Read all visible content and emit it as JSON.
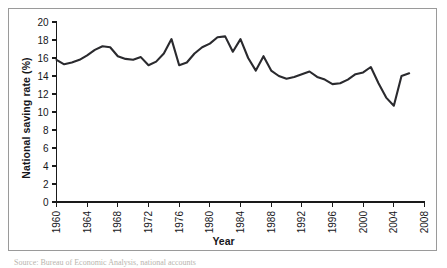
{
  "figure": {
    "caption_sliver": "Source: Bureau of Economic Analysis, national accounts"
  },
  "chart_data": {
    "type": "line",
    "title": "",
    "xlabel": "Year",
    "ylabel": "National saving rate (%)",
    "xlim": [
      1960,
      2008
    ],
    "ylim": [
      0,
      20
    ],
    "grid": false,
    "legend": "none",
    "x_ticks": [
      1960,
      1964,
      1968,
      1972,
      1976,
      1980,
      1984,
      1988,
      1992,
      1996,
      2000,
      2004,
      2008
    ],
    "y_ticks": [
      0,
      2,
      4,
      6,
      8,
      10,
      12,
      14,
      16,
      18,
      20
    ],
    "series": [
      {
        "name": "National saving rate",
        "color": "#2a2a2e",
        "x": [
          1960,
          1961,
          1962,
          1963,
          1964,
          1965,
          1966,
          1967,
          1968,
          1969,
          1970,
          1971,
          1972,
          1973,
          1974,
          1975,
          1976,
          1977,
          1978,
          1979,
          1980,
          1981,
          1982,
          1983,
          1984,
          1985,
          1986,
          1987,
          1988,
          1989,
          1990,
          1991,
          1992,
          1993,
          1994,
          1995,
          1996,
          1997,
          1998,
          1999,
          2000,
          2001,
          2002,
          2003,
          2004,
          2005,
          2006
        ],
        "values": [
          15.8,
          15.3,
          15.5,
          15.8,
          16.3,
          16.9,
          17.3,
          17.2,
          16.2,
          15.9,
          15.8,
          16.1,
          15.2,
          15.6,
          16.5,
          18.1,
          15.2,
          15.5,
          16.5,
          17.2,
          17.6,
          18.3,
          18.4,
          16.7,
          18.1,
          16.0,
          14.6,
          16.2,
          14.6,
          14.0,
          13.7,
          13.9,
          14.2,
          14.5,
          13.9,
          13.6,
          13.1,
          13.2,
          13.6,
          14.2,
          14.4,
          15.0,
          15.6,
          15.7,
          15.1,
          13.9,
          12.5
        ],
        "tail_x": [
          2001,
          2002,
          2003,
          2004,
          2005,
          2006
        ],
        "tail_values": [
          15.0,
          13.2,
          11.6,
          10.7,
          14.0,
          14.3
        ]
      }
    ],
    "notable_points": {
      "first_value": 15.8,
      "peak_value": 18.4,
      "peak_year": 1982,
      "trough_value": 10.7,
      "trough_year": 2003,
      "last_value": 14.3,
      "last_year": 2006
    }
  }
}
